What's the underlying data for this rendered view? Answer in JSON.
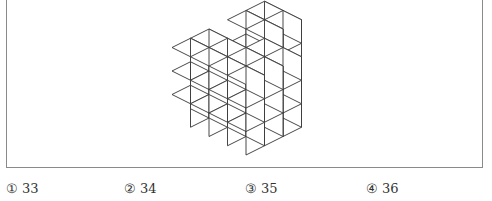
{
  "figure": {
    "stroke_color": "#333333",
    "fill_color": "#ffffff",
    "cube_geometry": {
      "dx": 18.5,
      "dy": 9.25,
      "h": 23.5,
      "origin_x": 246,
      "origin_y": 155
    },
    "heightmap": [
      [
        3,
        3,
        2,
        3,
        3
      ],
      [
        3,
        3,
        2,
        3,
        3
      ],
      [
        3,
        3,
        3,
        0,
        0
      ],
      [
        3,
        3,
        3,
        0,
        0
      ]
    ]
  },
  "options": [
    {
      "mark": "①",
      "value": "33"
    },
    {
      "mark": "②",
      "value": "34"
    },
    {
      "mark": "③",
      "value": "35"
    },
    {
      "mark": "④",
      "value": "36"
    }
  ]
}
